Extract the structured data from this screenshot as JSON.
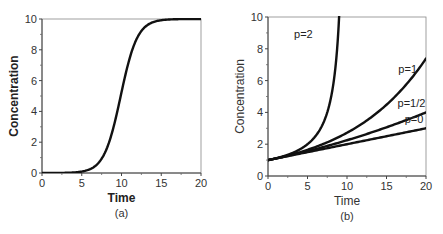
{
  "chart_data": [
    {
      "type": "line",
      "panel": "(a)",
      "caption": "(a)",
      "title": "",
      "xlabel": "Time",
      "ylabel": "Concentration",
      "xlim": [
        0,
        20
      ],
      "ylim": [
        0,
        10
      ],
      "xticks": [
        0,
        5,
        10,
        15,
        20
      ],
      "yticks": [
        0,
        2,
        4,
        6,
        8,
        10
      ],
      "xtick_labels": [
        "0",
        "5",
        "10",
        "15",
        "20"
      ],
      "ytick_labels": [
        "0",
        "2",
        "4",
        "6",
        "8",
        "10"
      ],
      "grid": false,
      "legend": null,
      "series": [
        {
          "name": "sigmoid",
          "x": [
            0,
            2,
            4,
            5,
            6,
            7,
            8,
            9,
            10,
            11,
            12,
            13,
            14,
            15,
            16,
            18,
            20
          ],
          "y": [
            0.0,
            0.0,
            0.02,
            0.05,
            0.15,
            0.5,
            1.4,
            3.2,
            5.5,
            7.6,
            8.9,
            9.5,
            9.8,
            9.93,
            9.97,
            9.99,
            10.0
          ]
        }
      ]
    },
    {
      "type": "line",
      "panel": "(b)",
      "caption": "(b)",
      "title": "",
      "xlabel": "Time",
      "ylabel": "Concentration",
      "xlim": [
        0,
        20
      ],
      "ylim": [
        0,
        10
      ],
      "xticks": [
        0,
        5,
        10,
        15,
        20
      ],
      "yticks": [
        0,
        2,
        4,
        6,
        8,
        10
      ],
      "xtick_labels": [
        "0",
        "5",
        "10",
        "15",
        "20"
      ],
      "ytick_labels": [
        "0",
        "2",
        "4",
        "6",
        "8",
        "10"
      ],
      "grid": false,
      "legend": "inline curve labels",
      "series": [
        {
          "name": "p=2",
          "x": [
            0,
            2,
            4,
            5,
            6,
            7,
            8,
            8.5,
            9.0
          ],
          "y": [
            1.0,
            1.25,
            1.67,
            2.0,
            2.5,
            3.33,
            5.0,
            6.67,
            10.0
          ]
        },
        {
          "name": "p=1",
          "x": [
            0,
            2,
            4,
            6,
            8,
            10,
            12,
            14,
            16,
            18,
            20
          ],
          "y": [
            1.0,
            1.22,
            1.49,
            1.82,
            2.23,
            2.72,
            3.32,
            4.06,
            4.95,
            6.05,
            7.39
          ]
        },
        {
          "name": "p=1/2",
          "x": [
            0,
            2,
            4,
            6,
            8,
            10,
            12,
            14,
            16,
            18,
            20
          ],
          "y": [
            1.0,
            1.21,
            1.44,
            1.69,
            1.96,
            2.25,
            2.56,
            2.89,
            3.24,
            3.61,
            4.0
          ]
        },
        {
          "name": "p=0",
          "x": [
            0,
            2,
            4,
            6,
            8,
            10,
            12,
            14,
            16,
            18,
            20
          ],
          "y": [
            1.0,
            1.2,
            1.4,
            1.6,
            1.8,
            2.0,
            2.2,
            2.4,
            2.6,
            2.8,
            3.0
          ]
        }
      ]
    }
  ],
  "panels": {
    "a": {
      "xlabel": "Time",
      "ylabel": "Concentration",
      "caption": "(a)"
    },
    "b": {
      "xlabel": "Time",
      "ylabel": "Concentration",
      "caption": "(b)",
      "curve_labels": [
        "p=2",
        "p=1",
        "p=1/2",
        "p=0"
      ]
    }
  }
}
